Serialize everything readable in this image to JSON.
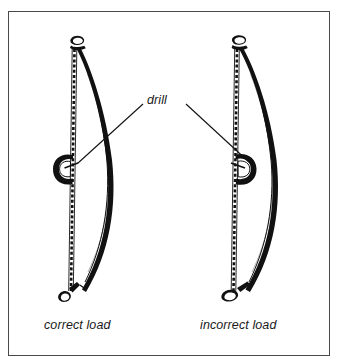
{
  "figure": {
    "frame": {
      "stroke_color": "#4a4a4a",
      "background": "#ffffff"
    },
    "ink_color": "#111111",
    "labels": {
      "drill": "drill",
      "caption_left": "correct load",
      "caption_right": "incorrect load"
    },
    "panels": [
      {
        "id": "left-panel",
        "name": "correct-load-illustration",
        "caption": "correct load",
        "description": "bow drill with drill spindle loaded on the outside of the string"
      },
      {
        "id": "right-panel",
        "name": "incorrect-load-illustration",
        "caption": "incorrect load",
        "description": "bow drill with drill spindle loaded on the inside of the string"
      }
    ],
    "leader_lines": [
      {
        "name": "leader-line-left",
        "from": [
          143,
          104
        ],
        "to": [
          77,
          163
        ]
      },
      {
        "name": "leader-line-right",
        "from": [
          186,
          104
        ],
        "to": [
          251,
          163
        ]
      }
    ]
  }
}
